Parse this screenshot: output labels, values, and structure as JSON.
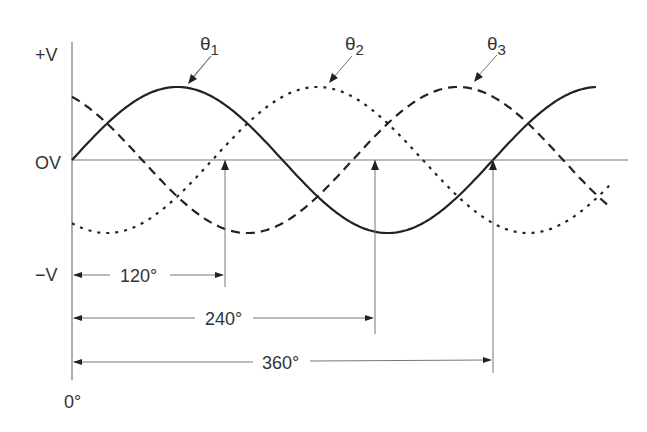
{
  "diagram": {
    "axis": {
      "y_labels": {
        "top": "+V",
        "zero": "OV",
        "bottom": "−V"
      },
      "origin_label": "0°"
    },
    "phases": [
      {
        "name": "theta1",
        "symbol": "θ",
        "subscript": "1",
        "offset_deg": 0,
        "style": "solid"
      },
      {
        "name": "theta2",
        "symbol": "θ",
        "subscript": "2",
        "offset_deg": 120,
        "style": "dotted"
      },
      {
        "name": "theta3",
        "symbol": "θ",
        "subscript": "3",
        "offset_deg": 240,
        "style": "dashed"
      }
    ],
    "dimensions": [
      {
        "label": "120°",
        "deg": 120
      },
      {
        "label": "240°",
        "deg": 240
      },
      {
        "label": "360°",
        "deg": 360
      }
    ],
    "colors": {
      "curve": "#222222",
      "axis": "#777777",
      "text": "#333333"
    }
  }
}
